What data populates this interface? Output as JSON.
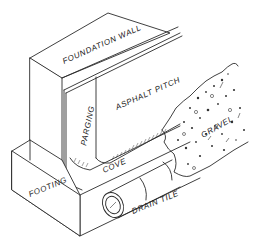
{
  "diagram": {
    "type": "isometric cross-section",
    "line_color": "#2a2a2a",
    "background": "#ffffff",
    "labels": {
      "foundation_wall": "FOUNDATION WALL",
      "asphalt_pitch": "ASPHALT PITCH",
      "parging": "PARGING",
      "gravel": "GRAVEL",
      "cove": "COVE",
      "footing": "FOOTING",
      "drain_tile": "DRAIN TILE"
    }
  }
}
